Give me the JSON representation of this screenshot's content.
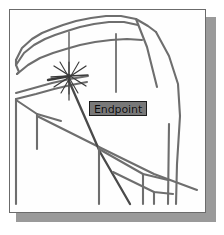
{
  "app": {
    "kind": "cad-drawing-viewport",
    "background_color": "#fefefe",
    "frame_border_color": "#6b6b6b",
    "shadow_color": "#9a9a9a"
  },
  "viewport": {
    "label": "drawing-viewport",
    "geometry_line_color": "#6e6e6e",
    "geometry_line_dark_color": "#4a4a4a"
  },
  "snap": {
    "type": "endpoint",
    "marker_name": "endpoint-snap-marker",
    "marker_color": "#3a3a3a",
    "marker_center_x": 67,
    "marker_center_y": 75,
    "tooltip_label": "Endpoint",
    "tooltip_background": "#787878",
    "tooltip_border": "#1c1c1c",
    "tooltip_text_color": "#0b0b0b"
  },
  "wireframe": {
    "description": "3D isometric wireframe model of a house-like solid",
    "edges": [
      {
        "name": "roof-ridge-top-left",
        "points": "14,58 20,45 30,36 40,30 49,25 59,21 72,16 86,13 101,11 115,11 131,15"
      },
      {
        "name": "roof-ridge-top-right",
        "points": "131,15 143,22 150,28"
      },
      {
        "name": "roof-face-second",
        "points": "14,62 22,49 32,40 43,34 53,29 64,25 77,21 91,18 105,16 119,16 133,20"
      },
      {
        "name": "eave-line-lower",
        "points": "15,71 26,62 38,55 50,50 63,46 77,42 92,39 108,37 124,36 138,37"
      },
      {
        "name": "left-vertical-post-outer",
        "points": "14,58 14,62"
      },
      {
        "name": "left-short-jog",
        "points": "14,62 16,68 15,71"
      },
      {
        "name": "center-vertical-mullion",
        "points": "67,28 67,96"
      },
      {
        "name": "eave-band-mid",
        "points": "14,90 30,85 48,80 66,76 84,73"
      },
      {
        "name": "eave-band-mid-lower",
        "points": "14,95 32,90 50,85 67,81 83,78"
      },
      {
        "name": "left-lower-vertical",
        "points": "14,95 14,140"
      },
      {
        "name": "left-lower-diagonal",
        "points": "14,96 34,110 58,117"
      },
      {
        "name": "left-floor-edge",
        "points": "14,140 14,200"
      },
      {
        "name": "floor-diagonal-left",
        "points": "34,110 34,145"
      },
      {
        "name": "long-floor-diagonal",
        "points": "34,112 96,143 150,170 192,186"
      },
      {
        "name": "ridge-to-right-apex",
        "points": "131,15 143,43 152,83"
      },
      {
        "name": "right-wall-upper",
        "points": "150,28 163,52 172,80 174,112"
      },
      {
        "name": "right-wall-lower",
        "points": "174,112 171,160 170,200"
      },
      {
        "name": "right-inner-vertical",
        "points": "164,120 163,200"
      },
      {
        "name": "mullion-right-short",
        "points": "113,30 113,88"
      },
      {
        "name": "descending-strut",
        "points": "67,77 97,148 126,200"
      },
      {
        "name": "floor-edge-interior",
        "points": "96,143 96,200"
      },
      {
        "name": "floor-panel-top",
        "points": "96,145 140,170 163,176"
      },
      {
        "name": "floor-panel-bottom",
        "points": "110,168 150,188 168,190"
      },
      {
        "name": "floor-panel-right-vert",
        "points": "150,188 150,200"
      },
      {
        "name": "floor-panel-left-vert",
        "points": "140,170 140,200"
      }
    ]
  }
}
